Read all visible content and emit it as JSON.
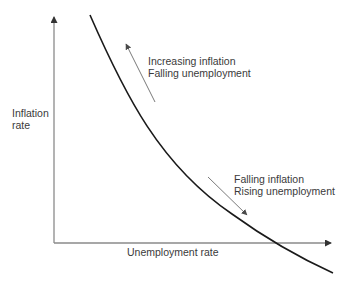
{
  "diagram": {
    "type": "curve-diagram",
    "axes": {
      "y_label_line1": "Inflation",
      "y_label_line2": "rate",
      "x_label": "Unemployment rate"
    },
    "annotations": [
      {
        "id": "upper",
        "line1": "Increasing inflation",
        "line2": "Falling unemployment",
        "arrow_direction": "up-left"
      },
      {
        "id": "lower",
        "line1": "Falling inflation",
        "line2": "Rising unemployment",
        "arrow_direction": "down-right"
      }
    ],
    "colors": {
      "curve": "#1a1a1a",
      "axis": "#8a8a8a",
      "arrow": "#7a7a7a",
      "text": "#3a3a3a",
      "background": "#ffffff"
    },
    "geometry": {
      "origin": [
        54,
        243
      ],
      "y_axis_top": [
        54,
        15
      ],
      "x_axis_end": [
        333,
        243
      ],
      "curve_path": "M 90 15 C 125 95, 160 165, 232 214 C 268 240, 300 258, 333 273",
      "arrow_up": {
        "from": [
          155,
          102
        ],
        "to": [
          126,
          44
        ]
      },
      "arrow_down": {
        "from": [
          208,
          177
        ],
        "to": [
          247,
          215
        ]
      }
    }
  }
}
